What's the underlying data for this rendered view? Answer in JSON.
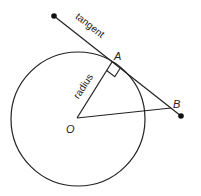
{
  "diagram": {
    "type": "geometry-tangent-radius",
    "stroke_color": "#222222",
    "circle": {
      "cx": 78,
      "cy": 119,
      "r": 67
    },
    "points": {
      "T": {
        "x": 54,
        "y": 16
      },
      "A": {
        "x": 112,
        "y": 62
      },
      "B": {
        "x": 181,
        "y": 116
      },
      "O": {
        "x": 77,
        "y": 118
      },
      "OB_end": {
        "x": 171,
        "y": 108
      }
    },
    "labels": {
      "A": "A",
      "B": "B",
      "O": "O",
      "tangent": "tangent",
      "radius": "radius"
    }
  }
}
